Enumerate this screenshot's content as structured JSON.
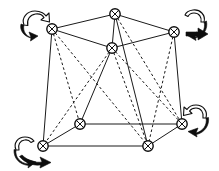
{
  "figure": {
    "name": "rotating-cube-graph-diagram",
    "type": "diagram",
    "width": 219,
    "height": 171,
    "background_color": "#ffffff",
    "line_color": "#1a1a1a",
    "arrow_color": "#0d0d0d",
    "node_fill_color": "#ffffff",
    "caption": "",
    "title": ""
  },
  "nodes": [
    {
      "id": "n-top-left",
      "label": "",
      "x": 52,
      "y": 29,
      "r": 5.2
    },
    {
      "id": "n-top-center",
      "label": "",
      "x": 115,
      "y": 14,
      "r": 5.2
    },
    {
      "id": "n-top-right",
      "label": "",
      "x": 174,
      "y": 32,
      "r": 5.2
    },
    {
      "id": "n-top-front",
      "label": "",
      "x": 112,
      "y": 48,
      "r": 5.2
    },
    {
      "id": "n-bottom-left",
      "label": "",
      "x": 43,
      "y": 146,
      "r": 5.2
    },
    {
      "id": "n-bottom-inner",
      "label": "",
      "x": 80,
      "y": 124,
      "r": 5.2
    },
    {
      "id": "n-bottom-front",
      "label": "",
      "x": 148,
      "y": 146,
      "r": 5.2
    },
    {
      "id": "n-bottom-right",
      "label": "",
      "x": 182,
      "y": 124,
      "r": 5.2
    }
  ],
  "edges": [
    {
      "id": "e-tl-tc",
      "from": "n-top-left",
      "to": "n-top-center",
      "style": "solid"
    },
    {
      "id": "e-tc-tr",
      "from": "n-top-center",
      "to": "n-top-right",
      "style": "solid"
    },
    {
      "id": "e-tl-tf",
      "from": "n-top-left",
      "to": "n-top-front",
      "style": "solid"
    },
    {
      "id": "e-tf-tr",
      "from": "n-top-front",
      "to": "n-top-right",
      "style": "solid"
    },
    {
      "id": "e-tc-tf",
      "from": "n-top-center",
      "to": "n-top-front",
      "style": "solid"
    },
    {
      "id": "e-bl-bi",
      "from": "n-bottom-left",
      "to": "n-bottom-inner",
      "style": "solid"
    },
    {
      "id": "e-bi-br",
      "from": "n-bottom-inner",
      "to": "n-bottom-right",
      "style": "solid"
    },
    {
      "id": "e-bl-bf",
      "from": "n-bottom-left",
      "to": "n-bottom-front",
      "style": "solid"
    },
    {
      "id": "e-bf-br",
      "from": "n-bottom-front",
      "to": "n-bottom-right",
      "style": "solid"
    },
    {
      "id": "e-tl-bl",
      "from": "n-top-left",
      "to": "n-bottom-left",
      "style": "solid"
    },
    {
      "id": "e-tr-br",
      "from": "n-top-right",
      "to": "n-bottom-right",
      "style": "solid"
    },
    {
      "id": "e-tc-bf",
      "from": "n-top-center",
      "to": "n-bottom-front",
      "style": "solid"
    },
    {
      "id": "e-tf-bi",
      "from": "n-top-front",
      "to": "n-bottom-inner",
      "style": "solid"
    },
    {
      "id": "e-tl-bi",
      "from": "n-top-left",
      "to": "n-bottom-inner",
      "style": "dashed"
    },
    {
      "id": "e-tl-bf",
      "from": "n-top-left",
      "to": "n-bottom-front",
      "style": "dashed"
    },
    {
      "id": "e-tc-br",
      "from": "n-top-center",
      "to": "n-bottom-right",
      "style": "dashed"
    },
    {
      "id": "e-tr-bf",
      "from": "n-top-right",
      "to": "n-bottom-front",
      "style": "dashed"
    },
    {
      "id": "e-tf-bf",
      "from": "n-top-front",
      "to": "n-bottom-front",
      "style": "dashed"
    },
    {
      "id": "e-tf-br",
      "from": "n-top-front",
      "to": "n-bottom-right",
      "style": "dashed"
    },
    {
      "id": "e-tf-bl",
      "from": "n-top-front",
      "to": "n-bottom-left",
      "style": "dashed"
    }
  ],
  "rotation_arrows": [
    {
      "id": "arrow-top-left",
      "label": "",
      "corner": "top-left",
      "direction": "counterclockwise",
      "cx": 36,
      "cy": 22
    },
    {
      "id": "arrow-top-right",
      "label": "",
      "corner": "top-right",
      "direction": "clockwise",
      "cx": 192,
      "cy": 26
    },
    {
      "id": "arrow-bottom-left",
      "label": "",
      "corner": "bottom-left",
      "direction": "clockwise",
      "cx": 28,
      "cy": 150
    },
    {
      "id": "arrow-bottom-right",
      "label": "",
      "corner": "bottom-right",
      "direction": "counterclockwise",
      "cx": 194,
      "cy": 120
    }
  ]
}
